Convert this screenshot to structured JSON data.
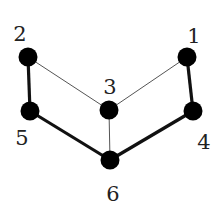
{
  "diagram": {
    "type": "graph",
    "nodes": [
      {
        "id": "1",
        "label": "1",
        "x": 187,
        "y": 57,
        "lx": 194,
        "ly": 43
      },
      {
        "id": "2",
        "label": "2",
        "x": 28,
        "y": 57,
        "lx": 20,
        "ly": 41
      },
      {
        "id": "3",
        "label": "3",
        "x": 109,
        "y": 110,
        "lx": 110,
        "ly": 94
      },
      {
        "id": "4",
        "label": "4",
        "x": 193,
        "y": 111,
        "lx": 204,
        "ly": 149
      },
      {
        "id": "5",
        "label": "5",
        "x": 30,
        "y": 111,
        "lx": 22,
        "ly": 145
      },
      {
        "id": "6",
        "label": "6",
        "x": 110,
        "y": 160,
        "lx": 113,
        "ly": 201
      }
    ],
    "edges": [
      {
        "from": "2",
        "to": "5",
        "weight": "thick"
      },
      {
        "from": "5",
        "to": "6",
        "weight": "thick"
      },
      {
        "from": "6",
        "to": "4",
        "weight": "thick"
      },
      {
        "from": "4",
        "to": "1",
        "weight": "thick"
      },
      {
        "from": "2",
        "to": "3",
        "weight": "thin"
      },
      {
        "from": "3",
        "to": "1",
        "weight": "thin"
      },
      {
        "from": "3",
        "to": "6",
        "weight": "thin"
      }
    ],
    "colors": {
      "node": "#000000",
      "thick_edge": "#111111",
      "thin_edge": "#555555",
      "label": "#222222"
    }
  }
}
